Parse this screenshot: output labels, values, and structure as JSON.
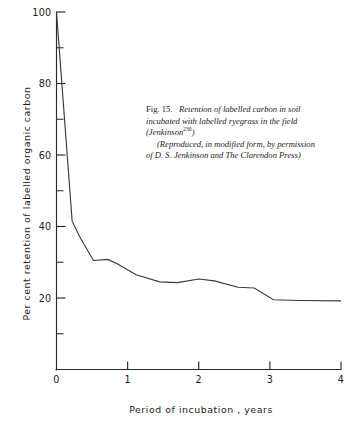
{
  "figure": {
    "number_label": "Fig. 15.",
    "caption_line_1": "Retention of labelled carbon in soil",
    "caption_line_2": "incubated with labelled ryegrass in the field",
    "caption_line_3_pre": "(Jenkinson",
    "caption_line_3_sup": "230",
    "caption_line_3_post": ")",
    "caption_line_4": "(Reproduced, in modified form, by permission",
    "caption_line_5": "of D. S. Jenkinson and The Clarendon Press)"
  },
  "chart_data": {
    "type": "line",
    "title": "Retention of labelled carbon in soil incubated with labelled ryegrass in the field",
    "xlabel": "Period of incubation , years",
    "ylabel": "Per cent retention of labelled organic carbon",
    "xlim": [
      0,
      4
    ],
    "ylim": [
      0,
      100
    ],
    "grid": false,
    "legend": "none",
    "x_ticks_major": [
      0,
      1,
      2,
      3,
      4
    ],
    "x_tick_labels": [
      "0",
      "1",
      "2",
      "3",
      "4"
    ],
    "y_ticks_major": [
      20,
      40,
      60,
      80,
      100
    ],
    "y_tick_labels": [
      "20",
      "40",
      "60",
      "80",
      "100"
    ],
    "y_ticks_minor": [
      10,
      30,
      50,
      70,
      90
    ],
    "series": [
      {
        "name": "Labelled carbon remaining",
        "x": [
          0.0,
          0.22,
          0.33,
          0.52,
          0.72,
          0.86,
          1.12,
          1.45,
          1.7,
          2.0,
          2.22,
          2.55,
          2.78,
          3.05,
          3.4,
          4.0
        ],
        "y": [
          100,
          41.5,
          37.0,
          30.5,
          30.8,
          29.5,
          26.5,
          24.5,
          24.3,
          25.3,
          24.8,
          23.0,
          22.8,
          19.5,
          19.3,
          19.2
        ]
      }
    ]
  }
}
